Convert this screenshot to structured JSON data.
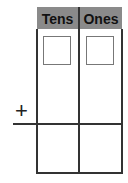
{
  "headers": [
    "Tens",
    "Ones"
  ],
  "operator": "+",
  "colors": {
    "header_bg": "#8a8a8a",
    "lines": "#333333"
  }
}
